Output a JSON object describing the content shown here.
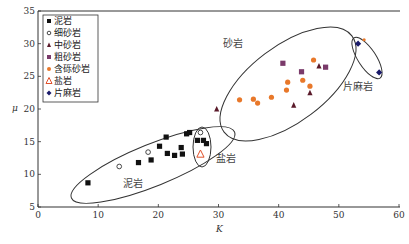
{
  "chart_data": {
    "type": "scatter",
    "title": "",
    "xlabel": "K",
    "ylabel": "μ",
    "xlim": [
      0,
      60
    ],
    "ylim": [
      5,
      35
    ],
    "x_ticks": [
      0,
      10,
      20,
      30,
      40,
      50,
      60
    ],
    "y_ticks": [
      5,
      10,
      15,
      20,
      25,
      30,
      35
    ],
    "grid": false,
    "legend_position": "upper-left",
    "series": [
      {
        "name": "泥岩",
        "marker": "square",
        "color": "#111111",
        "points": [
          [
            8.3,
            8.7
          ],
          [
            16.7,
            11.8
          ],
          [
            18.8,
            12.2
          ],
          [
            20.2,
            14.3
          ],
          [
            21.5,
            13.2
          ],
          [
            21.3,
            15.7
          ],
          [
            22.7,
            12.9
          ],
          [
            23.8,
            14.1
          ],
          [
            24.0,
            13.1
          ],
          [
            24.7,
            16.2
          ],
          [
            25.2,
            16.4
          ],
          [
            26.5,
            15.2
          ],
          [
            27.5,
            15.2
          ],
          [
            28.0,
            14.7
          ]
        ]
      },
      {
        "name": "细砂岩",
        "marker": "circle-open",
        "color": "#333333",
        "points": [
          [
            13.5,
            11.2
          ],
          [
            18.3,
            13.4
          ],
          [
            27.0,
            16.4
          ]
        ]
      },
      {
        "name": "中砂岩",
        "marker": "triangle",
        "color": "#5a1a2a",
        "points": [
          [
            29.7,
            20.0
          ],
          [
            42.5,
            20.6
          ],
          [
            45.2,
            22.5
          ],
          [
            46.7,
            26.6
          ]
        ]
      },
      {
        "name": "粗砂岩",
        "marker": "square",
        "color": "#7a3a6a",
        "points": [
          [
            40.7,
            27.0
          ],
          [
            43.8,
            25.7
          ],
          [
            47.8,
            26.4
          ]
        ]
      },
      {
        "name": "含砾砂岩",
        "marker": "circle",
        "color": "#e8782a",
        "points": [
          [
            45.8,
            27.5
          ],
          [
            41.5,
            24.1
          ],
          [
            44.0,
            24.4
          ],
          [
            41.3,
            22.9
          ],
          [
            45.2,
            23.5
          ],
          [
            35.8,
            21.5
          ],
          [
            38.8,
            21.8
          ],
          [
            33.5,
            21.4
          ],
          [
            36.5,
            20.9
          ],
          [
            54.2,
            30.6
          ]
        ]
      },
      {
        "name": "盐岩",
        "marker": "triangle-open",
        "color": "#e0502a",
        "points": [
          [
            27.0,
            13.1
          ]
        ]
      },
      {
        "name": "片麻岩",
        "marker": "diamond",
        "color": "#1a1a6a",
        "points": [
          [
            53.2,
            30.0
          ],
          [
            56.7,
            25.6
          ]
        ]
      }
    ],
    "annotations": [
      {
        "text": "砂岩",
        "x": 32,
        "y": 31
      },
      {
        "text": "片麻岩",
        "x": 52,
        "y": 21
      },
      {
        "text": "盐岩",
        "x": 30,
        "y": 14.3
      },
      {
        "text": "泥岩",
        "x": 14,
        "y": 8.5
      }
    ],
    "ellipses": [
      {
        "label": "泥岩",
        "cx": 19,
        "cy": 11.2,
        "rx": 14,
        "ry": 3.6,
        "rotate": -32
      },
      {
        "label": "盐岩",
        "cx": 27.3,
        "cy": 13.8,
        "rx": 1.6,
        "ry": 3.3,
        "rotate": 0
      },
      {
        "label": "砂岩",
        "cx": 42,
        "cy": 24.5,
        "rx": 13.5,
        "ry": 6,
        "rotate": -38
      },
      {
        "label": "片麻岩",
        "cx": 54.9,
        "cy": 27.9,
        "rx": 1.6,
        "ry": 3.6,
        "rotate": -33
      }
    ]
  },
  "legend": {
    "items": [
      "泥岩",
      "细砂岩",
      "中砂岩",
      "粗砂岩",
      "含砾砂岩",
      "盐岩",
      "片麻岩"
    ]
  },
  "axes": {
    "xlabel": "K",
    "ylabel": "μ"
  },
  "regions": {
    "sandstone": "砂岩",
    "schist": "片麻岩",
    "salt": "盐岩",
    "mudstone": "泥岩"
  }
}
